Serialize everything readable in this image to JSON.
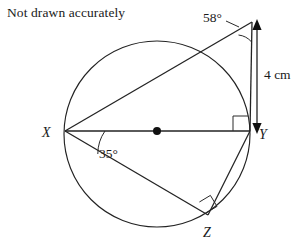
{
  "figure": {
    "note": "Not drawn accurately",
    "background_color": "#ffffff",
    "line_color": "#232323",
    "text_color": "#1a1a1a",
    "labels": {
      "point_x": "X",
      "point_y": "Y",
      "point_z": "Z",
      "angle_top": "58°",
      "angle_at_x": "35°",
      "length_right": "4 cm"
    },
    "geometry": {
      "type": "circle-with-inscribed-triangle",
      "circle": {
        "cx": 157,
        "cy": 134,
        "r": 93
      },
      "centre_dot": {
        "x": 157,
        "y": 131
      },
      "points": {
        "X": {
          "x": 65,
          "y": 131
        },
        "Y": {
          "x": 250,
          "y": 131
        },
        "Z": {
          "x": 208,
          "y": 215
        },
        "T": {
          "x": 252,
          "y": 22
        }
      },
      "segments": [
        {
          "from": "X",
          "to": "Y",
          "note": "diameter through centre"
        },
        {
          "from": "X",
          "to": "T",
          "note": "line from X to external apex"
        },
        {
          "from": "X",
          "to": "Z"
        },
        {
          "from": "Y",
          "to": "Z"
        }
      ],
      "right_angles": [
        {
          "at": "Y",
          "between": "XY and TY"
        },
        {
          "at": "Z",
          "between": "XZ and YZ"
        }
      ],
      "marked_angles": [
        {
          "at": "T",
          "value": "58°"
        },
        {
          "at": "X",
          "value": "35°",
          "between": "XY and XZ"
        }
      ],
      "dimension": {
        "label": "4 cm",
        "from": {
          "x": 257,
          "y": 22
        },
        "to": {
          "x": 257,
          "y": 131
        },
        "style": "double-headed-arrow"
      }
    }
  }
}
